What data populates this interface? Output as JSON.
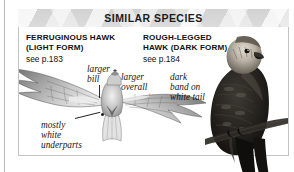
{
  "panel": {
    "title": "SIMILAR SPECIES",
    "species": [
      {
        "id": "ferruginous-hawk",
        "name": "FERRUGINOUS HAWK\n(LIGHT FORM)",
        "reference": "see p.183",
        "pose": "flight, from below"
      },
      {
        "id": "rough-legged-hawk",
        "name": "ROUGH-LEGGED\nHAWK (DARK FORM)",
        "reference": "see p.184",
        "pose": "perched"
      }
    ],
    "callouts": [
      {
        "id": "larger-bill",
        "text": "larger\nbill"
      },
      {
        "id": "larger-overall",
        "text": "larger\noverall"
      },
      {
        "id": "dark-band-tail",
        "text": "dark\nband on\nwhite tail"
      },
      {
        "id": "white-underparts",
        "text": "mostly\nwhite\nunderparts"
      }
    ]
  },
  "colors": {
    "header_band": "#d7d7d7",
    "panel_border": "#c4c4c4",
    "text": "#111111",
    "page_rule": "#b9b9b9"
  }
}
